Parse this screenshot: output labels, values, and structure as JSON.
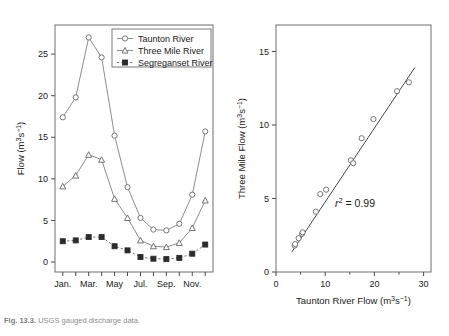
{
  "figure": {
    "caption_label": "Fig. 13.3.",
    "caption_text": "USGS gauged discharge data."
  },
  "chart_data": [
    {
      "type": "line",
      "title": "",
      "panel": "left",
      "xlabel": "",
      "ylabel": "Flow (m3s-1)",
      "ylabel_parts": {
        "base": "Flow (m",
        "sup1": "3",
        "mid": "s",
        "sup2": "−1",
        "tail": ")"
      },
      "categories": [
        "Jan.",
        "Feb.",
        "Mar.",
        "Apr.",
        "May",
        "Jun.",
        "Jul.",
        "Aug.",
        "Sep.",
        "Oct.",
        "Nov.",
        "Dec."
      ],
      "xtick_labels": [
        "Jan.",
        "Mar.",
        "May",
        "Jul.",
        "Sep.",
        "Nov."
      ],
      "xtick_indices": [
        0,
        2,
        4,
        6,
        8,
        10
      ],
      "ytick_labels": [
        "0",
        "5",
        "10",
        "15",
        "20",
        "25"
      ],
      "ytick_values": [
        0,
        5,
        10,
        15,
        20,
        25
      ],
      "xlim": [
        -0.6,
        11.6
      ],
      "ylim": [
        -1.2,
        28.5
      ],
      "grid": false,
      "legend_position": "top-right",
      "series": [
        {
          "name": "Taunton River",
          "marker": "open-circle",
          "values": [
            17.4,
            19.8,
            27.0,
            24.6,
            15.2,
            9.0,
            5.3,
            3.9,
            3.8,
            4.6,
            8.1,
            15.7
          ]
        },
        {
          "name": "Three Mile River",
          "marker": "open-triangle",
          "values": [
            9.1,
            10.4,
            12.9,
            12.3,
            7.6,
            5.3,
            2.6,
            1.9,
            1.8,
            2.3,
            4.1,
            7.4
          ]
        },
        {
          "name": "Segreganset River",
          "marker": "filled-square",
          "values": [
            2.5,
            2.6,
            3.0,
            3.0,
            1.9,
            1.4,
            0.6,
            0.4,
            0.35,
            0.5,
            1.0,
            2.1
          ]
        }
      ]
    },
    {
      "type": "scatter",
      "panel": "right",
      "title": "",
      "xlabel": "Taunton River Flow (m3s-1)",
      "xlabel_parts": {
        "base": "Taunton River Flow (m",
        "sup1": "3",
        "mid": "s",
        "sup2": "−1",
        "tail": ")"
      },
      "ylabel": "Three Mile Flow (m3s-1)",
      "ylabel_parts": {
        "base": "Three Mile Flow (m",
        "sup1": "3",
        "mid": "s",
        "sup2": "−1",
        "tail": ")"
      },
      "xtick_labels": [
        "0",
        "10",
        "20",
        "30"
      ],
      "xtick_values": [
        0,
        10,
        20,
        30
      ],
      "ytick_labels": [
        "0",
        "5",
        "10",
        "15"
      ],
      "ytick_values": [
        0,
        5,
        10,
        15
      ],
      "xlim": [
        0,
        31.5
      ],
      "ylim": [
        0,
        16.8
      ],
      "grid": false,
      "annotation": "r2 = 0.99",
      "annotation_parts": {
        "symbol": "r",
        "sup": "2",
        "rest": " = 0.99"
      },
      "points": [
        {
          "x": 3.8,
          "y": 1.8
        },
        {
          "x": 3.9,
          "y": 1.9
        },
        {
          "x": 4.6,
          "y": 2.3
        },
        {
          "x": 5.3,
          "y": 2.6
        },
        {
          "x": 5.4,
          "y": 2.7
        },
        {
          "x": 8.1,
          "y": 4.1
        },
        {
          "x": 9.0,
          "y": 5.3
        },
        {
          "x": 10.2,
          "y": 5.6
        },
        {
          "x": 15.2,
          "y": 7.6
        },
        {
          "x": 15.7,
          "y": 7.4
        },
        {
          "x": 17.4,
          "y": 9.1
        },
        {
          "x": 19.8,
          "y": 10.4
        },
        {
          "x": 24.6,
          "y": 12.3
        },
        {
          "x": 27.0,
          "y": 12.9
        }
      ],
      "fit_line": {
        "x1": 3.2,
        "y1": 1.35,
        "x2": 28.2,
        "y2": 13.9
      }
    }
  ]
}
